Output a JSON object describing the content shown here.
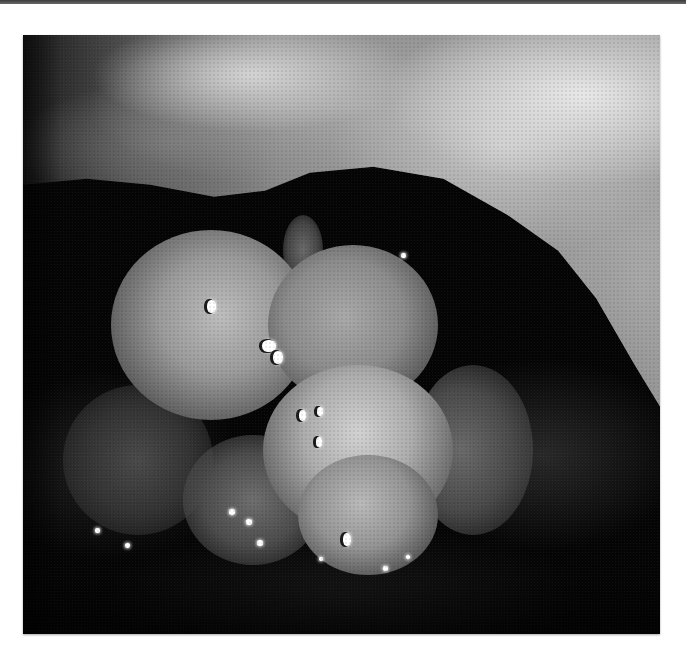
{
  "image": {
    "kind": "grayscale endoscopic photograph",
    "description": "Lobulated bright polypoid mass in a dark lumen, overhung by a pale mucosal fold at the top right, with scattered specular light reflections",
    "palette": {
      "background": "#ffffff",
      "top_rule": "#4a4a4a",
      "cavity": "#050505",
      "fold_highlight": "#e6e6e6",
      "mass_highlight": "#d2d2d2",
      "specular": "#ffffff"
    }
  },
  "highlights": [
    {
      "x": 184,
      "y": 265,
      "w": 9,
      "h": 13
    },
    {
      "x": 239,
      "y": 305,
      "w": 14,
      "h": 12
    },
    {
      "x": 250,
      "y": 316,
      "w": 10,
      "h": 13
    },
    {
      "x": 276,
      "y": 375,
      "w": 7,
      "h": 11
    },
    {
      "x": 294,
      "y": 372,
      "w": 6,
      "h": 9
    },
    {
      "x": 293,
      "y": 402,
      "w": 6,
      "h": 10
    },
    {
      "x": 320,
      "y": 498,
      "w": 8,
      "h": 13
    },
    {
      "x": 206,
      "y": 474,
      "w": 6,
      "h": 6
    },
    {
      "x": 223,
      "y": 484,
      "w": 6,
      "h": 6
    },
    {
      "x": 234,
      "y": 505,
      "w": 6,
      "h": 6
    },
    {
      "x": 102,
      "y": 508,
      "w": 5,
      "h": 5
    },
    {
      "x": 72,
      "y": 493,
      "w": 5,
      "h": 5
    },
    {
      "x": 360,
      "y": 531,
      "w": 5,
      "h": 5
    },
    {
      "x": 383,
      "y": 520,
      "w": 4,
      "h": 4
    },
    {
      "x": 378,
      "y": 218,
      "w": 5,
      "h": 5
    },
    {
      "x": 296,
      "y": 522,
      "w": 4,
      "h": 4
    }
  ]
}
